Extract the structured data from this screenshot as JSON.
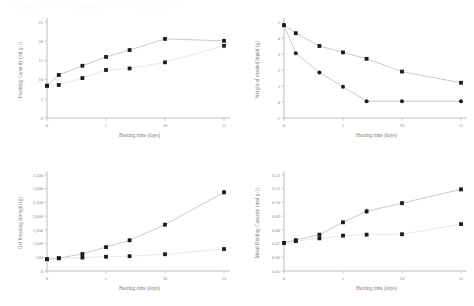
{
  "figure": {
    "background_color": "#ffffff",
    "marker_color": "#1c1c1c",
    "line_color": "#bdbdbd",
    "axis_color": "#b9b9b9",
    "text_color": "#7d7d7d",
    "panel_count": 4
  },
  "chart_data": [
    {
      "id": "foaming-capacity",
      "position": "top-left",
      "type": "scatter",
      "title": "",
      "xlabel": "Heating time (days)",
      "ylabel": "Foaming Capacity (ml g-1)",
      "xlim": [
        0,
        15
      ],
      "ylim": [
        0,
        25
      ],
      "xticks": [
        0,
        5,
        10,
        15
      ],
      "yticks": [
        0,
        5,
        10,
        15,
        20,
        25
      ],
      "xticklabels": [
        "0",
        "5",
        "10",
        "15"
      ],
      "yticklabels": [
        "0",
        "5",
        "10",
        "15",
        "20",
        "25"
      ],
      "grid": false,
      "legend": "none",
      "x": [
        0,
        1,
        3,
        5,
        7,
        10,
        15
      ],
      "series": [
        {
          "name": "Series 1",
          "marker": "square",
          "line": "solid",
          "values": [
            8.4,
            11.2,
            13.6,
            15.9,
            17.7,
            20.6,
            20.1
          ]
        },
        {
          "name": "Series 2",
          "marker": "square",
          "line": "dotted",
          "values": [
            8.4,
            8.6,
            10.4,
            12.5,
            12.9,
            14.5,
            18.8
          ]
        }
      ]
    },
    {
      "id": "weight-exuded-liquid",
      "position": "top-right",
      "type": "scatter",
      "title": "",
      "xlabel": "Heating time (days)",
      "ylabel": "Weight of exuded liquid (g)",
      "xlim": [
        0,
        15
      ],
      "ylim": [
        -1,
        5
      ],
      "xticks": [
        0,
        5,
        10,
        15
      ],
      "yticks": [
        -1,
        0,
        1,
        2,
        3,
        4,
        5
      ],
      "xticklabels": [
        "0",
        "5",
        "10",
        "15"
      ],
      "yticklabels": [
        "-1",
        "0",
        "1",
        "2",
        "3",
        "4",
        "5"
      ],
      "grid": false,
      "legend": "none",
      "x": [
        0,
        1,
        3,
        5,
        7,
        10,
        15
      ],
      "series": [
        {
          "name": "Series 1",
          "marker": "square",
          "line": "solid",
          "values": [
            4.8,
            4.3,
            3.5,
            3.1,
            2.7,
            1.9,
            1.2
          ]
        },
        {
          "name": "Series 2",
          "marker": "circle",
          "line": "solid",
          "values": [
            4.8,
            3.05,
            1.85,
            0.95,
            0.05,
            0.05,
            0.05
          ]
        }
      ]
    },
    {
      "id": "gel-breaking-strength",
      "position": "bottom-left",
      "type": "scatter",
      "title": "",
      "xlabel": "Heating time (days)",
      "ylabel": "Gel breaking strength (g)",
      "xlim": [
        0,
        15
      ],
      "ylim": [
        0,
        3500
      ],
      "xticks": [
        0,
        5,
        10,
        15
      ],
      "yticks": [
        0,
        500,
        1000,
        1500,
        2000,
        2500,
        3000,
        3500
      ],
      "xticklabels": [
        "0",
        "5",
        "10",
        "15"
      ],
      "yticklabels": [
        "0",
        "500",
        "1,000",
        "1,500",
        "2,000",
        "2,500",
        "3,000",
        "3,500"
      ],
      "grid": false,
      "legend": "none",
      "x": [
        0,
        1,
        3,
        5,
        7,
        10,
        15
      ],
      "series": [
        {
          "name": "Series 1",
          "marker": "square",
          "line": "solid",
          "values": [
            430,
            470,
            620,
            870,
            1120,
            1690,
            2870
          ],
          "errors": [
            30,
            25,
            35,
            45,
            55,
            70,
            95
          ]
        },
        {
          "name": "Series 2",
          "marker": "square",
          "line": "dotted",
          "values": [
            430,
            460,
            490,
            520,
            540,
            610,
            800
          ],
          "errors": [
            20,
            20,
            22,
            25,
            25,
            30,
            40
          ]
        }
      ]
    },
    {
      "id": "metal-binding-capacity",
      "position": "bottom-right",
      "type": "scatter",
      "title": "",
      "xlabel": "Heating time (days)",
      "ylabel": "Metal Binding Capacity (mol g-1)",
      "xlim": [
        0,
        15
      ],
      "ylim": [
        0.05,
        0.12
      ],
      "xticks": [
        0,
        5,
        10,
        15
      ],
      "yticks": [
        0.05,
        0.06,
        0.07,
        0.08,
        0.09,
        0.1,
        0.11,
        0.12
      ],
      "xticklabels": [
        "0",
        "5",
        "10",
        "15"
      ],
      "yticklabels": [
        "0.05",
        "0.06",
        "0.07",
        "0.08",
        "0.09",
        "0.10",
        "0.11",
        "0.12"
      ],
      "grid": false,
      "legend": "none",
      "x": [
        0,
        1,
        3,
        5,
        7,
        10,
        15
      ],
      "series": [
        {
          "name": "Series 1",
          "marker": "square",
          "line": "solid",
          "values": [
            0.0705,
            0.0725,
            0.0765,
            0.0855,
            0.0935,
            0.0995,
            0.1095
          ],
          "errors": [
            0.0012,
            0.0012,
            0.0012,
            0.0014,
            0.0022,
            0.0016,
            0.0014
          ]
        },
        {
          "name": "Series 2",
          "marker": "square",
          "line": "dotted",
          "values": [
            0.0705,
            0.0718,
            0.0738,
            0.0758,
            0.0765,
            0.0768,
            0.0842
          ],
          "errors": [
            0.0012,
            0.001,
            0.001,
            0.0012,
            0.0012,
            0.0012,
            0.0012
          ]
        }
      ]
    }
  ]
}
